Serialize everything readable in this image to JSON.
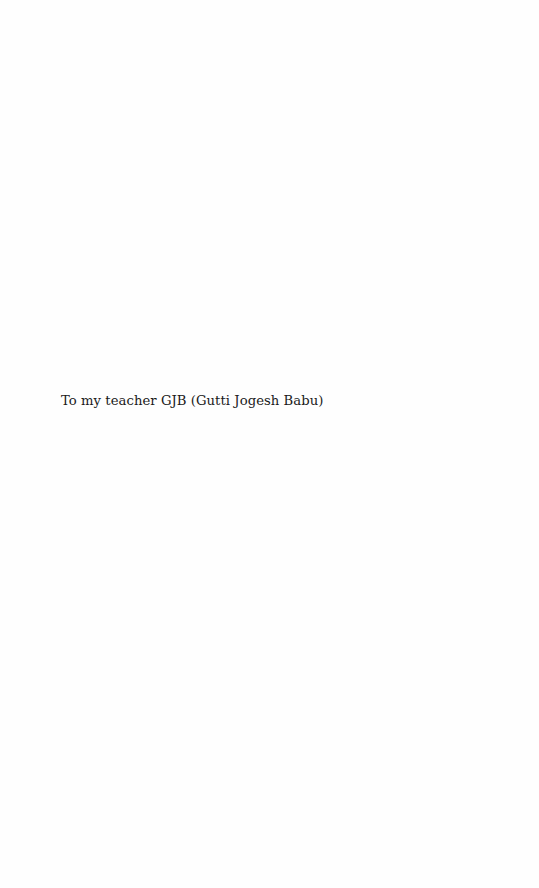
{
  "page": {
    "type": "dedication",
    "dedication_text": "To my teacher GJB (Gutti Jogesh Babu)"
  }
}
